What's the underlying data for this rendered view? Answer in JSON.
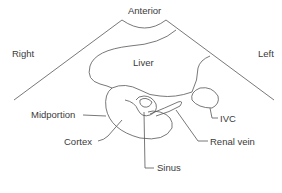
{
  "diagram": {
    "type": "ultrasound transverse view schematic",
    "orientation": {
      "top": "Anterior",
      "left": "Right",
      "right": "Left"
    },
    "structures": {
      "liver": "Liver",
      "midportion": "Midportion",
      "cortex": "Cortex",
      "sinus": "Sinus",
      "ivc": "IVC",
      "renal_vein": "Renal vein"
    },
    "colors": {
      "line": "#555555",
      "text": "#3a3a3a",
      "background": "#ffffff"
    }
  }
}
